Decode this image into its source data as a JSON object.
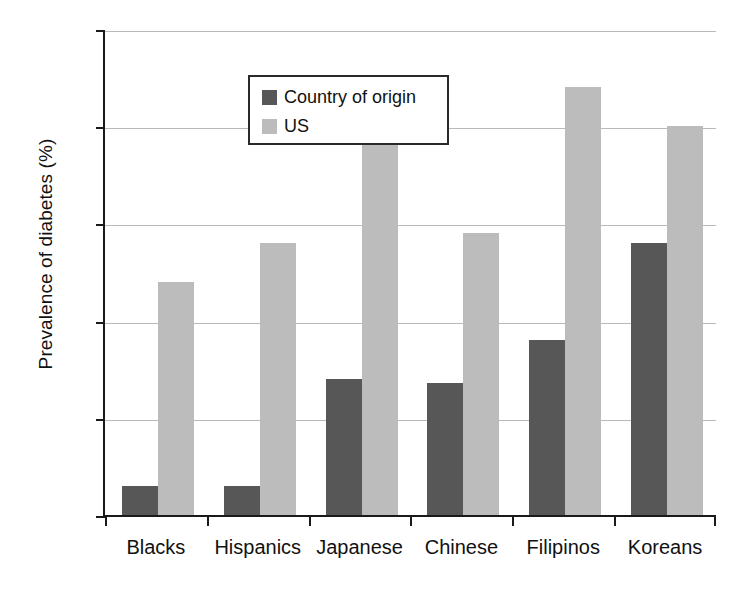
{
  "chart_data": {
    "type": "bar",
    "title": "",
    "xlabel": "",
    "ylabel": "Prevalence of diabetes (%)",
    "ylim": [
      0,
      25
    ],
    "yticks": [
      0,
      5,
      10,
      15,
      20,
      25
    ],
    "ytick_labels": [
      "0",
      "5",
      "10",
      "15",
      "20",
      "25"
    ],
    "grid": true,
    "legend_position": "top-left-inside",
    "categories": [
      "Blacks",
      "Hispanics",
      "Japanese",
      "Chinese",
      "Filipinos",
      "Koreans"
    ],
    "series": [
      {
        "name": "Country of origin",
        "color": "#575757",
        "values": [
          1.5,
          1.5,
          7.0,
          6.8,
          9.0,
          14.0
        ]
      },
      {
        "name": "US",
        "color": "#bcbcbc",
        "values": [
          12.0,
          14.0,
          20.0,
          14.5,
          22.0,
          20.0
        ]
      }
    ]
  },
  "legend": {
    "entries": [
      {
        "label": "Country of origin",
        "swatch": "dark-gray-swatch-icon"
      },
      {
        "label": "US",
        "swatch": "light-gray-swatch-icon"
      }
    ]
  },
  "colors": {
    "series_origin": "#575757",
    "series_us": "#bcbcbc",
    "axis": "#1a1a1a",
    "gridline": "#b9b9b9",
    "text": "#111111",
    "background": "#ffffff"
  }
}
